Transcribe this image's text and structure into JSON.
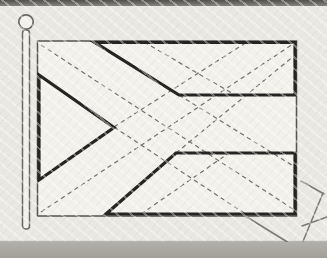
{
  "page": {
    "description": "scanned-line-drawing-of-flag-construction",
    "width": 327,
    "height": 258
  },
  "colors": {
    "paper": "#ebe9e4",
    "flag_face": "#f3f2ed",
    "ink_thick": "#232220",
    "ink_thin": "#54524d",
    "ink_dash": "#716f69",
    "pole": "#6b6964",
    "tag": "#7b7973",
    "edge_dark": "#514f4b",
    "edge_mid": "#85837d",
    "strip": "#a19f97",
    "strip_light": "#b2b1a9"
  },
  "figure": {
    "flag": {
      "x": 37.5,
      "y": 41,
      "width": 259,
      "height": 175
    },
    "pole": {
      "shaft_x": 22.5,
      "shaft_y": 30,
      "shaft_width": 7,
      "shaft_height": 199,
      "ball_cx": 26,
      "ball_cy": 22,
      "ball_r": 7.2
    },
    "shapes": [
      {
        "name": "top-band",
        "points": "95,42.5 295,42.5 295,95 179,95"
      },
      {
        "name": "bottom-band",
        "points": "106,214 295,214 295,153 176,153"
      },
      {
        "name": "hoist-triangle",
        "points": "39,75 114,127.5 39,180"
      }
    ],
    "construction_lines": [
      [
        41,
        45,
        293,
        209
      ],
      [
        41,
        212,
        293,
        44
      ],
      [
        179,
        95,
        295,
        167
      ],
      [
        176,
        153,
        295,
        55
      ],
      [
        114,
        127,
        247,
        215
      ],
      [
        114,
        127,
        247,
        42
      ],
      [
        144,
        42,
        235,
        95
      ],
      [
        141,
        214,
        229,
        153
      ]
    ],
    "tag_lines": [
      [
        246,
        216.5,
        302,
        251
      ],
      [
        299,
        251,
        323,
        193
      ],
      [
        324,
        194,
        301,
        181
      ],
      [
        302,
        226,
        327,
        217
      ]
    ]
  }
}
